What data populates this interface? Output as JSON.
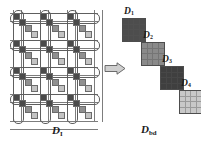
{
  "figure": {
    "type": "diagram",
    "arrow_icon": "right-arrow-icon"
  },
  "left_matrix": {
    "label_base": "D",
    "label_sub": "I",
    "grid_rows": 4,
    "grid_cols": 3,
    "staircase_shades": [
      "dark",
      "dark",
      "mid",
      "lite"
    ],
    "pill_count_horizontal": 4,
    "pill_count_vertical": 3
  },
  "right_matrix": {
    "label_base": "D",
    "label_sub": "bd",
    "blocks": [
      {
        "label_base": "D",
        "label_sub": "1",
        "shade": "#4d4d4d",
        "size": 4
      },
      {
        "label_base": "D",
        "label_sub": "2",
        "shade": "#8a8a8a",
        "size": 4
      },
      {
        "label_base": "D",
        "label_sub": "3",
        "shade": "#3f3f3f",
        "size": 4
      },
      {
        "label_base": "D",
        "label_sub": "4",
        "shade": "#c8c8c8",
        "size": 4
      }
    ]
  },
  "colors": {
    "dark": "#4a4a4a",
    "mid": "#8f8f8f",
    "light": "#c3c3c3",
    "line": "#7d7d7d",
    "outline": "#5e5e5e",
    "text": "#1a1a1a",
    "background": "#ffffff"
  }
}
